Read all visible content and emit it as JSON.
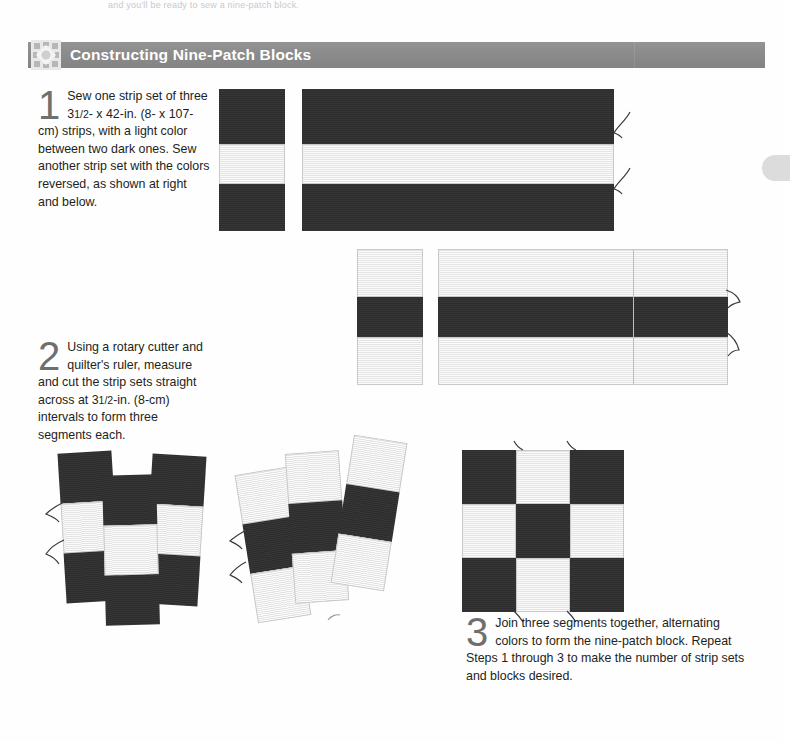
{
  "page": {
    "top_bleed_text": "and you'll be ready to sew a nine-patch block."
  },
  "header": {
    "title": "Constructing Nine-Patch Blocks",
    "icon": "nine-patch-star-icon",
    "bar_color": "#8b8b8b",
    "title_color": "#ffffff"
  },
  "colors": {
    "dark_fabric": "#2d2d2d",
    "light_fabric": "#e4e4e4",
    "fabric_outline": "#c9c9c9",
    "step_number": "#6f6f6f",
    "body_text": "#231f20"
  },
  "steps": [
    {
      "number": "1",
      "text": "Sew one strip set of three 3¹⁄₂- x 42-in. (8- x 107-cm) strips, with a light color between two dark ones. Sew another strip set with the colors reversed, as shown at right and below.",
      "lead": "Sew one strip set of",
      "rest": "three 3 1/2- x 42-in. (8- x 107-cm) strips, with a light color between two dark ones. Sew another strip set with the colors reversed, as shown at right and below."
    },
    {
      "number": "2",
      "text": "Using a rotary cutter and quilter's ruler, measure and cut the strip sets straight across at 3¹⁄₂-in. (8-cm) intervals to form three segments each.",
      "lead": "Using a rotary cutter",
      "rest": "and quilter's ruler, measure and cut the strip sets straight across at 3 1/2-in. (8-cm) intervals to form three segments each."
    },
    {
      "number": "3",
      "text": "Join three segments together, alternating colors to form the nine-patch block. Repeat Steps 1 through 3 to make the number of strip sets and blocks desired.",
      "lead": "Join three segments together,",
      "rest": "alternating colors to form the nine-patch block. Repeat Steps 1 through 3 to make the number of strip sets and blocks desired."
    }
  ],
  "diagram": {
    "strip_set_a": {
      "label": "dark-light-dark strip set",
      "end_view_rows": [
        "dark",
        "light",
        "dark"
      ],
      "long_view_rows": [
        "dark",
        "light",
        "dark"
      ]
    },
    "strip_set_b": {
      "label": "light-dark-light strip set",
      "end_view_rows": [
        "light",
        "dark",
        "light"
      ],
      "long_view_rows": [
        "light",
        "dark",
        "light"
      ]
    },
    "segments_dark": {
      "label": "cut dark-light-dark segments",
      "count": 3,
      "rows": [
        "dark",
        "light",
        "dark"
      ]
    },
    "segments_light": {
      "label": "cut light-dark-light segments",
      "count": 3,
      "rows": [
        "light",
        "dark",
        "light"
      ]
    },
    "nine_patch": {
      "label": "finished nine-patch block",
      "grid": [
        [
          "dark",
          "light",
          "dark"
        ],
        [
          "light",
          "dark",
          "light"
        ],
        [
          "dark",
          "light",
          "dark"
        ]
      ]
    }
  }
}
